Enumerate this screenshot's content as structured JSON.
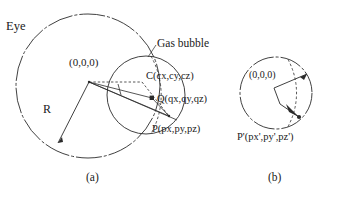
{
  "figure": {
    "caption_a": "(a)",
    "caption_b": "(b)"
  },
  "panel_a": {
    "eye_label": "Eye",
    "gas_bubble_label": "Gas bubble",
    "origin_label": "(0,0,0)",
    "center_label": "C(cx,cy,cz)",
    "q_label": "Q(qx,qy,qz)",
    "p_label": "P(px,py,pz)",
    "radius_label": "R"
  },
  "panel_b": {
    "origin_label": "(0,0,0)",
    "p_prime_label": "P'(px',py',pz')"
  },
  "geometry": {
    "stroke_color": "#2b2b2b",
    "eye_circle": {
      "cx": 88,
      "cy": 86,
      "r": 72
    },
    "bubble_circle": {
      "cx": 146,
      "cy": 95,
      "r": 39
    },
    "bubble_dashed_arc": {
      "cx": 106,
      "cy": 95,
      "r": 79
    },
    "right_circle": {
      "cx": 276,
      "cy": 93,
      "r": 36
    },
    "right_dashed_arc": {
      "cx": 238,
      "cy": 93,
      "r": 76
    },
    "point_origin": {
      "x": 89,
      "y": 82
    },
    "point_c": {
      "x": 142,
      "y": 82
    },
    "point_q": {
      "x": 152,
      "y": 98
    },
    "point_p": {
      "x": 169,
      "y": 116
    },
    "point_r_end": {
      "x": 58,
      "y": 143
    },
    "right_origin": {
      "x": 274,
      "y": 88
    },
    "right_v": {
      "x": 280,
      "y": 104
    },
    "right_top": {
      "x": 307,
      "y": 74
    },
    "right_pt": {
      "x": 299,
      "y": 117
    }
  }
}
